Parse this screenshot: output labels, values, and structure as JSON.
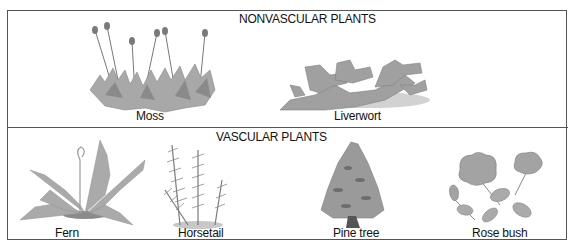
{
  "diagram": {
    "title_nonvascular": "NONVASCULAR PLANTS",
    "title_vascular": "VASCULAR PLANTS",
    "nonvascular": [
      {
        "label": "Moss",
        "icon": "moss-illustration"
      },
      {
        "label": "Liverwort",
        "icon": "liverwort-illustration"
      }
    ],
    "vascular": [
      {
        "label": "Fern",
        "icon": "fern-illustration"
      },
      {
        "label": "Horsetail",
        "icon": "horsetail-illustration"
      },
      {
        "label": "Pine tree",
        "icon": "pine-tree-illustration"
      },
      {
        "label": "Rose bush",
        "icon": "rose-bush-illustration"
      }
    ],
    "colors": {
      "border": "#555555",
      "text": "#111111",
      "plant_light": "#b8b8b8",
      "plant_mid": "#9a9a9a",
      "plant_dark": "#6e6e6e"
    }
  }
}
